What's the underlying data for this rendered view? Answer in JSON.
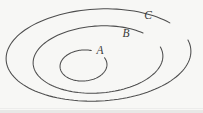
{
  "figure": {
    "kind": "nested-ellipses-set-diagram",
    "background_color": "#f7f7f5",
    "stroke_color": "#4d4d4d",
    "label_color": "#3a3a3a",
    "width": 203,
    "height": 113
  },
  "chart_data": {
    "type": "diagram",
    "title": "",
    "xlabel": "",
    "ylabel": "",
    "regions": [
      {
        "id": "A",
        "label": "A",
        "level": 1,
        "role": "innermost",
        "cx": 83.5,
        "cy": 65.5,
        "rx": 23.5,
        "ry": 15.5,
        "rotation": -4,
        "gap_start_deg": -68,
        "gap_end_deg": -24,
        "label_x": 100,
        "label_y": 54
      },
      {
        "id": "B",
        "label": "B",
        "level": 2,
        "role": "middle",
        "cx": 98.0,
        "cy": 59.5,
        "rx": 65.0,
        "ry": 33.5,
        "rotation": -4,
        "gap_start_deg": -44,
        "gap_end_deg": -14,
        "label_x": 126,
        "label_y": 37
      },
      {
        "id": "C",
        "label": "C",
        "level": 3,
        "role": "outermost",
        "cx": 98.5,
        "cy": 55.0,
        "rx": 92.5,
        "ry": 46.0,
        "rotation": -3,
        "gap_start_deg": -38,
        "gap_end_deg": -13,
        "label_x": 148,
        "label_y": 19
      }
    ],
    "containment": "A ⊂ B ⊂ C",
    "legend": []
  }
}
